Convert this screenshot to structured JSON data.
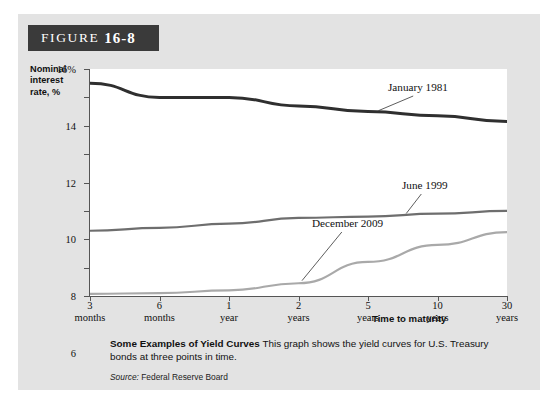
{
  "figure": {
    "word": "FIGURE",
    "number": "16-8"
  },
  "axis": {
    "ylabel": "Nominal interest rate, %",
    "xlabel": "Time to maturity",
    "yticks": [
      "16%",
      "14",
      "12",
      "10",
      "8",
      "6",
      "4",
      "2",
      "0"
    ]
  },
  "caption": {
    "lede": "Some Examples of Yield Curves",
    "body": "This graph shows the yield curves for U.S. Treasury bonds at three points in time.",
    "source_label": "Source:",
    "source_text": "Federal Reserve Board"
  },
  "chart_data": {
    "type": "line",
    "title": "Some Examples of Yield Curves",
    "xlabel": "Time to maturity",
    "ylabel": "Nominal interest rate, %",
    "ylim": [
      0,
      16
    ],
    "ytick_step": 2,
    "grid": false,
    "legend": "inline-labels",
    "categories": [
      "3 months",
      "6 months",
      "1 year",
      "2 years",
      "5 years",
      "10 years",
      "30 years"
    ],
    "category_lines": [
      [
        "3",
        "months"
      ],
      [
        "6",
        "months"
      ],
      [
        "1",
        "year"
      ],
      [
        "2",
        "years"
      ],
      [
        "5",
        "years"
      ],
      [
        "10",
        "years"
      ],
      [
        "30",
        "years"
      ]
    ],
    "series": [
      {
        "name": "January 1981",
        "color": "#2f2f2f",
        "values": [
          15.0,
          14.0,
          14.0,
          13.4,
          13.0,
          12.7,
          12.3
        ]
      },
      {
        "name": "June 1999",
        "color": "#6e6e6e",
        "values": [
          4.6,
          4.8,
          5.1,
          5.5,
          5.6,
          5.8,
          6.0
        ]
      },
      {
        "name": "December 2009",
        "color": "#a9a9a9",
        "values": [
          0.15,
          0.2,
          0.4,
          0.9,
          2.4,
          3.6,
          4.5
        ]
      }
    ]
  }
}
